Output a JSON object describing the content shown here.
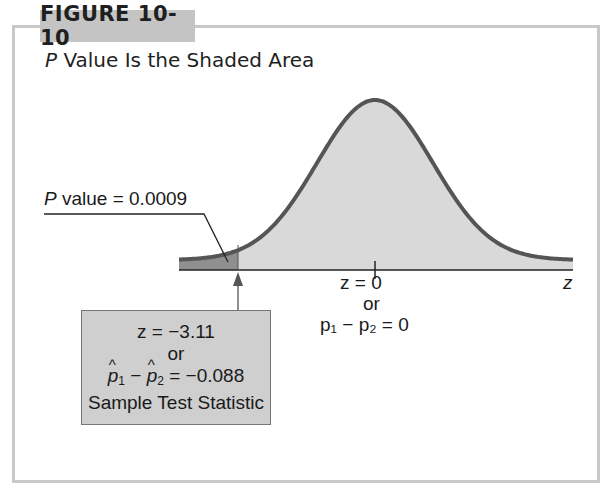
{
  "figure": {
    "label": "FIGURE 10-10",
    "title_italic": "P",
    "title_rest": " Value Is the Shaded Area"
  },
  "annotations": {
    "p_value_italic": "P",
    "p_value_rest": " value = 0.0009",
    "axis_variable": "z",
    "center_z": "z = 0",
    "center_or": "or",
    "center_diff": "p₁ − p₂ = 0"
  },
  "stat_box": {
    "line1": "z = −3.11",
    "line2": "or",
    "line3_value": " = −0.088",
    "line4": "Sample Test Statistic"
  },
  "colors": {
    "frame": "#c8c8c8",
    "label_bg": "#c4c4c4",
    "curve": "#555555",
    "fill_light": "#d9d9d9",
    "fill_dark": "#8f8f8f",
    "stat_box_bg": "#cfcfcf"
  },
  "chart_data": {
    "type": "area",
    "title": "P Value Is the Shaded Area",
    "distribution": "standard normal",
    "xlabel": "z",
    "center": 0,
    "test_statistic_z": -3.11,
    "test_statistic_diff": -0.088,
    "p_value": 0.0009,
    "shaded_tail": "left",
    "annotations": [
      "P value = 0.0009",
      "z = 0 or p1 − p2 = 0",
      "z = −3.11 or p̂1 − p̂2 = −0.088 Sample Test Statistic"
    ]
  }
}
